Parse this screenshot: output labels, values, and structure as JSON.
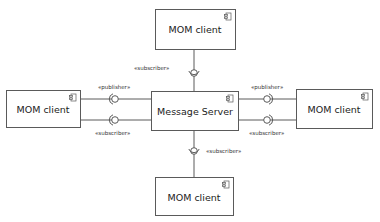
{
  "diagram": {
    "type": "uml-component",
    "colors": {
      "stroke": "#5a5a5a",
      "text": "#222222",
      "background": "#ffffff"
    },
    "components": [
      {
        "id": "top",
        "label": "MOM client",
        "icon": "component-icon"
      },
      {
        "id": "left",
        "label": "MOM client",
        "icon": "component-icon"
      },
      {
        "id": "center",
        "label": "Message Server",
        "icon": "component-icon"
      },
      {
        "id": "right",
        "label": "MOM client",
        "icon": "component-icon"
      },
      {
        "id": "bottom",
        "label": "MOM client",
        "icon": "component-icon"
      }
    ],
    "connectors": [
      {
        "from": "top",
        "to": "center",
        "stereotype": "«subscriber»"
      },
      {
        "from": "left",
        "to": "center",
        "stereotype": "«publisher»"
      },
      {
        "from": "left",
        "to": "center",
        "stereotype": "«subscriber»"
      },
      {
        "from": "right",
        "to": "center",
        "stereotype": "«publisher»"
      },
      {
        "from": "right",
        "to": "center",
        "stereotype": "«subscriber»"
      },
      {
        "from": "bottom",
        "to": "center",
        "stereotype": "«subscriber»"
      }
    ]
  }
}
